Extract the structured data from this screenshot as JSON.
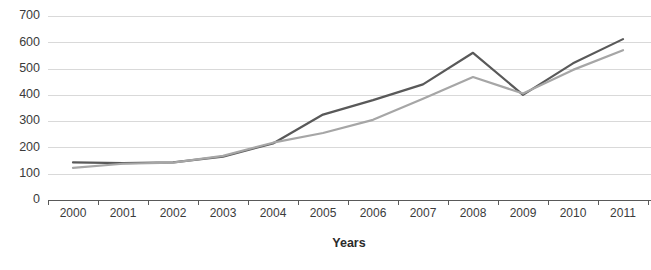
{
  "chart_data": {
    "type": "line",
    "title": "",
    "xlabel": "Years",
    "ylabel": "",
    "categories": [
      "2000",
      "2001",
      "2002",
      "2003",
      "2004",
      "2005",
      "2006",
      "2007",
      "2008",
      "2009",
      "2010",
      "2011"
    ],
    "series": [
      {
        "name": "series-dark",
        "color": "#595959",
        "values": [
          143,
          140,
          143,
          165,
          215,
          325,
          380,
          440,
          560,
          400,
          520,
          612
        ]
      },
      {
        "name": "series-light",
        "color": "#a6a6a6",
        "values": [
          122,
          138,
          142,
          168,
          218,
          255,
          305,
          385,
          468,
          405,
          495,
          570
        ]
      }
    ],
    "ylim": [
      0,
      700
    ],
    "yticks": [
      0,
      100,
      200,
      300,
      400,
      500,
      600,
      700
    ],
    "ytick_labels": [
      "0",
      "100",
      "200",
      "300",
      "400",
      "500",
      "600",
      "700"
    ],
    "grid": true,
    "grid_color": "#d9d9d9",
    "axis_color": "#595959",
    "legend": "none",
    "legend_position": "none"
  },
  "axes": {
    "x_axis_title": "Years"
  },
  "colors": {
    "background": "#ffffff",
    "series_dark": "#595959",
    "series_light": "#a6a6a6",
    "gridline": "#d9d9d9",
    "axis": "#595959",
    "tick_text": "#3b3b3b"
  }
}
